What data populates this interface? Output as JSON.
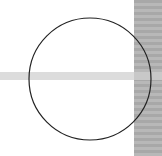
{
  "canvas": {
    "width": 162,
    "height": 156,
    "background": "#ffffff"
  },
  "shapes": {
    "circle": {
      "cx": 90,
      "cy": 79,
      "r": 61,
      "stroke": "#222222",
      "fill": "none"
    },
    "right_strip": {
      "color_dark": "#a8a8a8",
      "color_light": "#b8b8b8"
    },
    "horizontal_band": {
      "color": "#dcdcdc"
    }
  }
}
